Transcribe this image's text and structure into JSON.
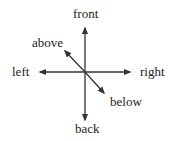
{
  "diagram": {
    "type": "direction-axes",
    "labels": {
      "front": "front",
      "back": "back",
      "left": "left",
      "right": "right",
      "above": "above",
      "below": "below"
    },
    "colors": {
      "line": "#333333",
      "text": "#222222",
      "background": "#ffffff"
    }
  }
}
